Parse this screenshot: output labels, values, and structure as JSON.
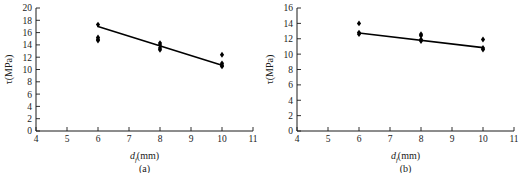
{
  "figure": {
    "background": "#ffffff",
    "point_color": "#000000",
    "line_color": "#000000",
    "axis_color": "#1a1a1a"
  },
  "panels": [
    {
      "id": "a",
      "caption": "(a)",
      "xlabel_main": "d",
      "xlabel_sub": "f",
      "xlabel_unit": "(mm)",
      "ylabel": "τ(MPa)",
      "x_ticks": [
        "4",
        "5",
        "6",
        "7",
        "8",
        "9",
        "10",
        "11"
      ],
      "y_ticks": [
        "0",
        "2",
        "4",
        "6",
        "8",
        "10",
        "12",
        "14",
        "16",
        "18",
        "20"
      ]
    },
    {
      "id": "b",
      "caption": "(b)",
      "xlabel_main": "d",
      "xlabel_sub": "f",
      "xlabel_unit": "(mm)",
      "ylabel": "τ(MPa)",
      "x_ticks": [
        "4",
        "5",
        "6",
        "7",
        "8",
        "9",
        "10",
        "11"
      ],
      "y_ticks": [
        "0",
        "2",
        "4",
        "6",
        "8",
        "10",
        "12",
        "14",
        "16"
      ]
    }
  ],
  "chart_data": [
    {
      "type": "scatter",
      "panel": "a",
      "title": "(a)",
      "xlabel": "d_f (mm)",
      "ylabel": "τ (MPa)",
      "xlim": [
        4,
        11
      ],
      "ylim": [
        0,
        20
      ],
      "xtick_step": 1,
      "ytick_step": 2,
      "grid": false,
      "legend": "none",
      "series": [
        {
          "name": "measurements",
          "marker": "filled-diamond",
          "x": [
            6,
            6,
            6,
            6,
            8,
            8,
            8,
            8,
            10,
            10,
            10,
            10
          ],
          "y": [
            17.3,
            15.2,
            14.9,
            14.7,
            14.3,
            14.0,
            13.5,
            13.2,
            12.4,
            11.0,
            10.7,
            10.5
          ]
        },
        {
          "name": "fitted trend line",
          "type": "line",
          "x": [
            6,
            10
          ],
          "y": [
            17.0,
            10.7
          ]
        }
      ]
    },
    {
      "type": "scatter",
      "panel": "b",
      "title": "(b)",
      "xlabel": "d_f (mm)",
      "ylabel": "τ (MPa)",
      "xlim": [
        4,
        11
      ],
      "ylim": [
        0,
        16
      ],
      "xtick_step": 1,
      "ytick_step": 2,
      "grid": false,
      "legend": "none",
      "series": [
        {
          "name": "measurements",
          "marker": "filled-diamond",
          "x": [
            6,
            6,
            6,
            8,
            8,
            8,
            8,
            10,
            10,
            10
          ],
          "y": [
            14.0,
            12.8,
            12.6,
            12.6,
            12.4,
            11.9,
            11.7,
            11.9,
            10.8,
            10.6
          ]
        },
        {
          "name": "fitted trend line",
          "type": "line",
          "x": [
            6,
            10
          ],
          "y": [
            12.75,
            10.85
          ]
        }
      ]
    }
  ]
}
